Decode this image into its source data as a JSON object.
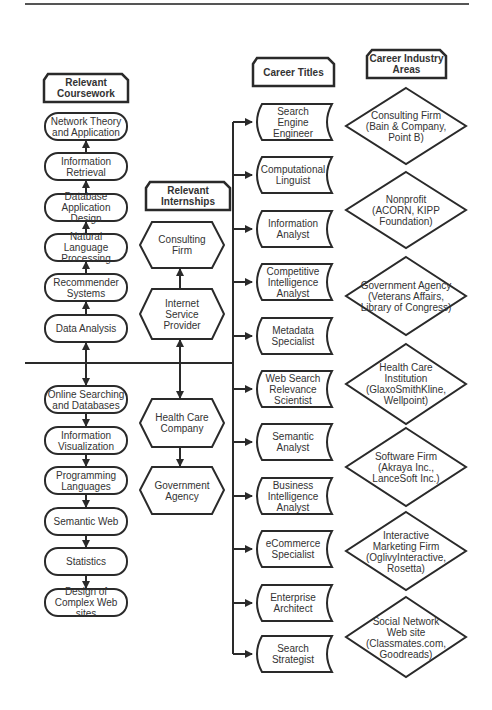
{
  "headers": {
    "coursework": "Relevant Coursework",
    "internships": "Relevant Internships",
    "career_titles": "Career Titles",
    "industry_areas": "Career Industry Areas"
  },
  "coursework_upper": [
    "Network Theory and Application",
    "Information Retrieval",
    "Database Application Design",
    "Natural Language Processing",
    "Recommender Systems",
    "Data Analysis"
  ],
  "coursework_lower": [
    "Online Searching and Databases",
    "Information Visualization",
    "Programming Languages",
    "Semantic Web",
    "Statistics",
    "Design of Complex Web sites"
  ],
  "internships": [
    "Consulting Firm",
    "Internet Service Provider",
    "Health Care Company",
    "Government Agency"
  ],
  "career_titles": [
    "Search Engine Engineer",
    "Computational Linguist",
    "Information Analyst",
    "Competitive Intelligence Analyst",
    "Metadata Specialist",
    "Web Search Relevance Scientist",
    "Semantic Analyst",
    "Business Intelligence Analyst",
    "eCommerce Specialist",
    "Enterprise Architect",
    "Search Strategist"
  ],
  "industry_areas": [
    "Consulting Firm (Bain & Company, Point B)",
    "Nonprofit (ACORN, KIPP Foundation)",
    "Government Agency (Veterans Affairs, Library of Congress)",
    "Health Care Institution (GlaxoSmithKline, Wellpoint)",
    "Software Firm (Akraya Inc., LanceSoft Inc.)",
    "Interactive Marketing Firm (OglivyInteractive, Rosetta)",
    "Social Network Web site (Classmates.com, Goodreads)"
  ],
  "colors": {
    "stroke": "#2a2a2a",
    "text": "#333333",
    "background": "#ffffff"
  }
}
